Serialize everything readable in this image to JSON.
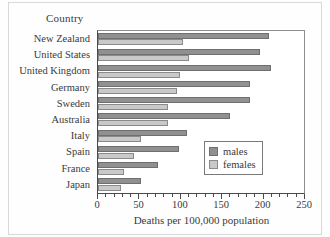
{
  "chart_data": {
    "type": "bar",
    "orientation": "horizontal",
    "title": "",
    "xlabel": "Deaths per 100,000 population",
    "ylabel": "Country",
    "xlim": [
      0,
      250
    ],
    "xticks": [
      0,
      50,
      100,
      150,
      200,
      250
    ],
    "xtick_labels": [
      "0",
      "50",
      "100",
      "150",
      "200",
      "250"
    ],
    "minor_tick_step": 10,
    "grid": false,
    "legend_position": "lower right",
    "categories": [
      "New Zealand",
      "United States",
      "United Kingdom",
      "Germany",
      "Sweden",
      "Australia",
      "Italy",
      "Spain",
      "France",
      "Japan"
    ],
    "series": [
      {
        "name": "males",
        "color": "#909090",
        "values": [
          207,
          196,
          209,
          184,
          184,
          159,
          107,
          98,
          73,
          52
        ]
      },
      {
        "name": "females",
        "color": "#c9c9c9",
        "values": [
          103,
          110,
          99,
          96,
          85,
          85,
          52,
          44,
          31,
          28
        ]
      }
    ]
  },
  "legend": {
    "items": [
      {
        "label": "males",
        "color": "#909090"
      },
      {
        "label": "females",
        "color": "#c9c9c9"
      }
    ]
  },
  "axis": {
    "y_header": "Country",
    "x_title": "Deaths per 100,000 population"
  },
  "colors": {
    "males": "#909090",
    "females": "#c9c9c9",
    "axis": "#4a4a4a",
    "text": "#3a3a3a",
    "frame": "#d8d8d8"
  }
}
